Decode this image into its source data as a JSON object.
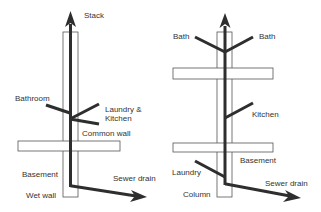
{
  "diagram": {
    "colors": {
      "pipe": "#2e2e2e",
      "wall": "#555555",
      "text": "#333333",
      "background": "#ffffff"
    },
    "left": {
      "title": "Wet wall layout",
      "labels": {
        "stack": "Stack",
        "bathroom": "Bathroom",
        "laundry_line1": "Laundry &",
        "laundry_line2": "Kitchen",
        "common_wall": "Common wall",
        "basement": "Basement",
        "sewer_drain": "Sewer drain",
        "wet_wall": "Wet wall"
      }
    },
    "right": {
      "title": "Column layout",
      "labels": {
        "bath_left": "Bath",
        "bath_right": "Bath",
        "kitchen": "Kitchen",
        "basement": "Basement",
        "laundry": "Laundry",
        "sewer_drain": "Sewer drain",
        "column": "Column"
      }
    }
  }
}
